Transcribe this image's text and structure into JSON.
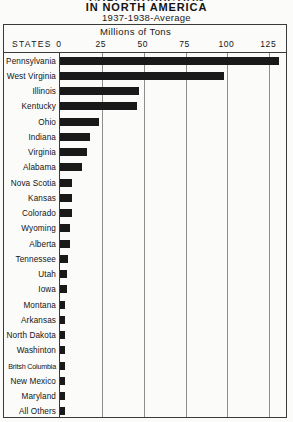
{
  "title": {
    "cut_line": "COAL PRODUCTION",
    "main": "IN NORTH AMERICA",
    "subtitle": "1937-1938-Average"
  },
  "header": {
    "states_label": "STATES",
    "scale_caption": "Millions of Tons"
  },
  "chart_data": {
    "type": "bar",
    "orientation": "horizontal",
    "title": "COAL PRODUCTION IN NORTH AMERICA",
    "subtitle": "1937-1938-Average",
    "xlabel": "Millions of Tons",
    "ylabel": "STATES",
    "xlim": [
      0,
      135
    ],
    "xticks": [
      0,
      25,
      50,
      75,
      100,
      125
    ],
    "xtick_labels": [
      "0",
      "25",
      "50",
      "75",
      "100",
      "125"
    ],
    "grid": "vertical-only",
    "legend": "none",
    "bar_color": "#191919",
    "categories": [
      "Pennsylvania",
      "West Virginia",
      "Illinois",
      "Kentucky",
      "Ohio",
      "Indiana",
      "Virginia",
      "Alabama",
      "Nova Scotia",
      "Kansas",
      "Colorado",
      "Wyoming",
      "Alberta",
      "Tennessee",
      "Utah",
      "Iowa",
      "Montana",
      "Arkansas",
      "North Dakota",
      "Washinton",
      "Britsh Columbia",
      "New Mexico",
      "Maryland",
      "All Others"
    ],
    "values": [
      131,
      98,
      47,
      46,
      23,
      18,
      16,
      13,
      7,
      7,
      7,
      6,
      6,
      5,
      4,
      4,
      3,
      3,
      3,
      3,
      3,
      3,
      3,
      3
    ]
  }
}
